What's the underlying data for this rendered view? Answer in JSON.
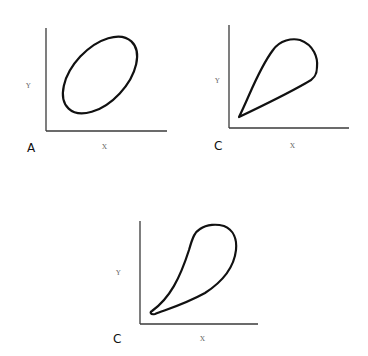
{
  "figure": {
    "panels": [
      {
        "id": "A",
        "letter": "A",
        "x_label": "X",
        "y_label": "Y",
        "shape": "tilted-ellipse"
      },
      {
        "id": "B",
        "letter": "B",
        "x_label": "X",
        "y_label": "Y",
        "shape": "teardrop-loop"
      },
      {
        "id": "C",
        "letter": "C",
        "x_label": "X",
        "y_label": "Y",
        "shape": "elongated-teardrop-loop"
      }
    ]
  },
  "colors": {
    "curve": "#111111",
    "axis": "#3a3a3a",
    "label": "#666666",
    "background": "#ffffff"
  }
}
